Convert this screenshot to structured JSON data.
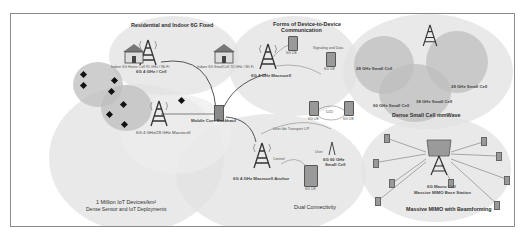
{
  "diagram": {
    "zones": {
      "residential": {
        "title": "Residential and Indoor 6G Fixed",
        "left_house_label": "Indoor 6G Home Cell 95 GHz / Wi-Fi",
        "right_house_label": "Indoor 6G SmallCell 70 GHz / Wi-Fi",
        "tower_label": "6G 4 GHz / Cell"
      },
      "d2d": {
        "title_line1": "Forms of Device-to-Device",
        "title_line2": "Communication",
        "signaling_label": "Signaling and Data",
        "ue_top_label": "6G UE",
        "ue_mid_label": "6G UE",
        "d2d_link_label": "D2D",
        "ue_left_label": "6G UE",
        "ue_right_label": "6G UE",
        "tower_label": "6G 4 GHz Macrocell"
      },
      "mmwave": {
        "title": "Dense Small Cell mmWave",
        "cell_a": "28 GHz Small Cell",
        "cell_b": "28 GHz Small Cell",
        "cell_c": "38 GHz Small Cell",
        "cell_d": "60 GHz Small Cell"
      },
      "iot": {
        "title_line1": "1 Million IoT Devices/km²",
        "title_line2": "Dense Sensor and IoT Deployments",
        "tower_label": "6G 4 GHz/28 GHz Macrocell"
      },
      "backhaul": {
        "label": "Mobile Core Backhaul"
      },
      "dual": {
        "title": "Dual Connectivity",
        "tower_label": "6G 4 GHz Macrocell Anchor",
        "user_plane_label": "User-Ide Transport L/P",
        "control_label": "Control",
        "user_label": "User",
        "small_cell_line1": "6G 60 GHz",
        "small_cell_line2": "Small Cell",
        "ue_label": "6G UE"
      },
      "mimo": {
        "title": "Massive MIMO with Beamforming",
        "station_line1": "6G Macro Cell",
        "station_line2": "Massive MIMO Base Station"
      }
    },
    "colors": {
      "zone_fill": "#e2e2e2",
      "inner_fill": "#bebebe",
      "line": "#555555",
      "frame": "#8a8a8a"
    }
  }
}
